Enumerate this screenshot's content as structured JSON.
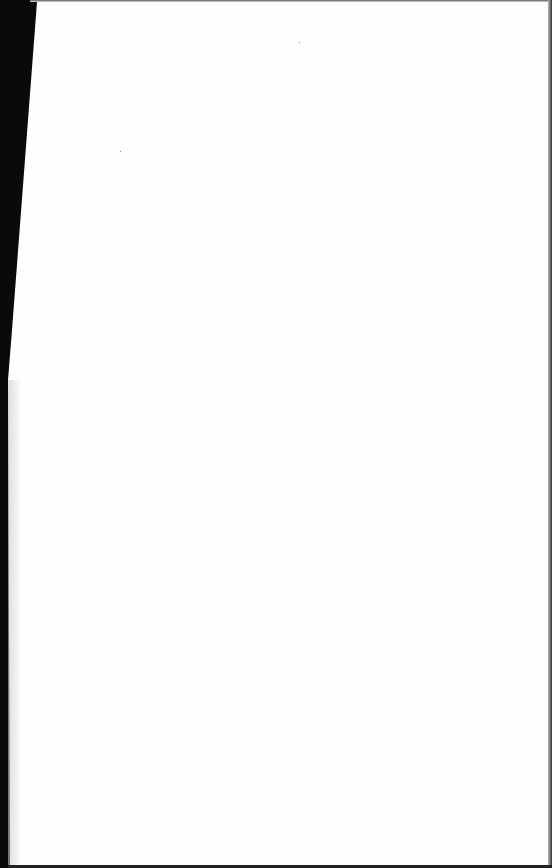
{
  "document": {
    "type": "scanned-page",
    "content": "",
    "page_color": "#fefefe",
    "background_color": "#000000"
  }
}
